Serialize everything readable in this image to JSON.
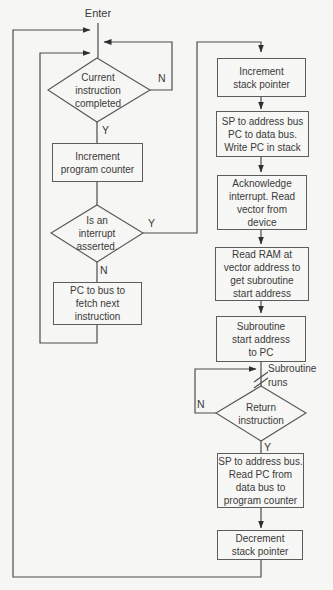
{
  "diagram": {
    "type": "flowchart",
    "colors": {
      "background": "#f6f6f4",
      "line": "#4c4c4c",
      "box_border": "#5c5c5c",
      "text": "#3a3a3a"
    },
    "entry_label": "Enter",
    "nodes": {
      "decision_current_instruction": {
        "type": "decision",
        "label": "Current\ninstruction\ncompleted"
      },
      "process_increment_pc": {
        "type": "process",
        "label": "Increment\nprogram counter"
      },
      "decision_interrupt_asserted": {
        "type": "decision",
        "label": "Is an\ninterrupt\nasserted."
      },
      "process_fetch_next": {
        "type": "process",
        "label": "PC to bus to\nfetch next\ninstruction"
      },
      "process_increment_sp": {
        "type": "process",
        "label": "Increment\nstack pointer"
      },
      "process_push_pc": {
        "type": "process",
        "label": "SP to address bus\nPC to data bus.\nWrite PC in stack"
      },
      "process_ack_interrupt": {
        "type": "process",
        "label": "Acknowledge\ninterrupt. Read\nvector from\ndevice"
      },
      "process_read_ram": {
        "type": "process",
        "label": "Read RAM at\nvector address to\nget subroutine\nstart address"
      },
      "process_subroutine_start": {
        "type": "process",
        "label": "Subroutine\nstart address\nto PC"
      },
      "decision_return_instruction": {
        "type": "decision",
        "label": "Return\ninstruction"
      },
      "process_pop_pc": {
        "type": "process",
        "label": "SP to address bus.\nRead PC from\ndata bus to\nprogram counter"
      },
      "process_decrement_sp": {
        "type": "process",
        "label": "Decrement\nstack pointer"
      }
    },
    "branch_labels": {
      "current_instruction_no": "N",
      "current_instruction_yes": "Y",
      "interrupt_yes": "Y",
      "interrupt_no": "N",
      "return_no": "N",
      "return_yes": "Y"
    },
    "annotations": {
      "subroutine_runs": "Subroutine\nruns"
    }
  }
}
